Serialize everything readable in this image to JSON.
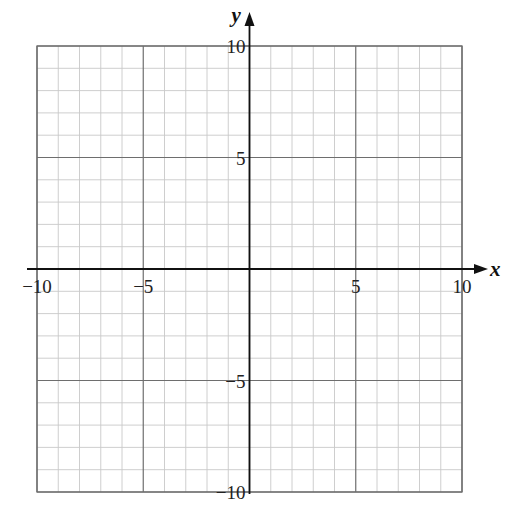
{
  "chart_data": {
    "type": "table",
    "title": "",
    "xlabel": "x",
    "ylabel": "y",
    "xlim": [
      -10,
      10
    ],
    "ylim": [
      -10,
      10
    ],
    "grid": true,
    "grid_minor_step": 2,
    "grid_major_step": 5,
    "x_ticks": [
      -10,
      -5,
      5,
      10
    ],
    "y_ticks": [
      -10,
      -5,
      5,
      10
    ],
    "x_tick_labels": [
      "−10",
      "−5",
      "5",
      "10"
    ],
    "y_tick_labels": [
      "−10",
      "−5",
      "5",
      "10"
    ],
    "series": [],
    "legend": null
  },
  "colors": {
    "minor_grid": "#c8c8c8",
    "major_grid": "#6e6e6e",
    "axis": "#111111",
    "background": "#ffffff"
  },
  "layout": {
    "grid_left": 37,
    "grid_right": 462,
    "grid_top": 46,
    "grid_bottom": 492,
    "origin_x": 248,
    "origin_y": 268
  }
}
